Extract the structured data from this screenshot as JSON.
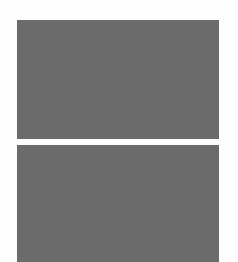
{
  "panels": [
    {
      "name": "image-placeholder-top",
      "color": "#6b6b6b"
    },
    {
      "name": "image-placeholder-bottom",
      "color": "#6b6b6b"
    }
  ],
  "background": "#fdfdfd"
}
